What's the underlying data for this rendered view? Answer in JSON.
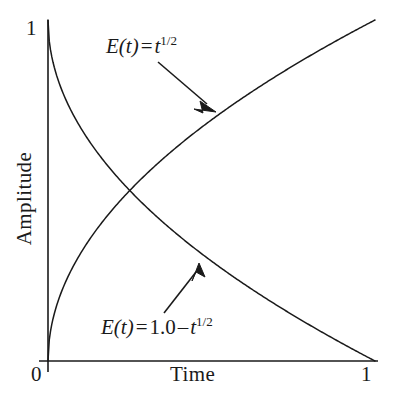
{
  "figure": {
    "background_color": "#ffffff",
    "ink_color": "#1a1a1a"
  },
  "axes": {
    "x_title": "Time",
    "y_title": "Amplitude",
    "x_tick_min": "0",
    "x_tick_max": "1",
    "y_tick_max": "1",
    "y_tick_min": "0"
  },
  "annotations": {
    "rising": {
      "func": "E",
      "arg": "(t)",
      "equals": "=",
      "var": "t",
      "exponent": "1/2"
    },
    "falling": {
      "func": "E",
      "arg": "(t)",
      "equals": "=",
      "constant": "1.0",
      "minus": "–",
      "var": "t",
      "exponent": "1/2"
    }
  },
  "chart_data": {
    "type": "line",
    "title": "",
    "xlabel": "Time",
    "ylabel": "Amplitude",
    "xlim": [
      0,
      1
    ],
    "ylim": [
      0,
      1
    ],
    "xticks": [
      0,
      1
    ],
    "yticks": [
      0,
      1
    ],
    "grid": false,
    "legend": "inline-annotations-with-arrows",
    "series": [
      {
        "name": "E(t) = t^1/2",
        "label_text": "E(t) = t^{1/2}",
        "x": [
          0,
          0.01,
          0.02,
          0.04,
          0.06,
          0.09,
          0.12,
          0.16,
          0.2,
          0.25,
          0.3,
          0.36,
          0.42,
          0.49,
          0.56,
          0.64,
          0.72,
          0.81,
          0.9,
          1.0
        ],
        "y": [
          0,
          0.1,
          0.141,
          0.2,
          0.245,
          0.3,
          0.346,
          0.4,
          0.447,
          0.5,
          0.548,
          0.6,
          0.648,
          0.7,
          0.748,
          0.8,
          0.849,
          0.9,
          0.949,
          1.0
        ]
      },
      {
        "name": "E(t) = 1.0 - t^1/2",
        "label_text": "E(t) = 1.0 – t^{1/2}",
        "x": [
          0,
          0.01,
          0.02,
          0.04,
          0.06,
          0.09,
          0.12,
          0.16,
          0.2,
          0.25,
          0.3,
          0.36,
          0.42,
          0.49,
          0.56,
          0.64,
          0.72,
          0.81,
          0.9,
          1.0
        ],
        "y": [
          1.0,
          0.9,
          0.859,
          0.8,
          0.755,
          0.7,
          0.654,
          0.6,
          0.553,
          0.5,
          0.452,
          0.4,
          0.352,
          0.3,
          0.252,
          0.2,
          0.151,
          0.1,
          0.051,
          0.0
        ]
      }
    ],
    "intersection": {
      "x": 0.25,
      "y": 0.5
    },
    "arrows": [
      {
        "target_series": "E(t) = t^1/2",
        "from": [
          0.32,
          0.9
        ],
        "to": [
          0.5,
          0.72
        ]
      },
      {
        "target_series": "E(t) = 1.0 - t^1/2",
        "from": [
          0.36,
          0.145
        ],
        "to": [
          0.455,
          0.27
        ]
      }
    ]
  }
}
